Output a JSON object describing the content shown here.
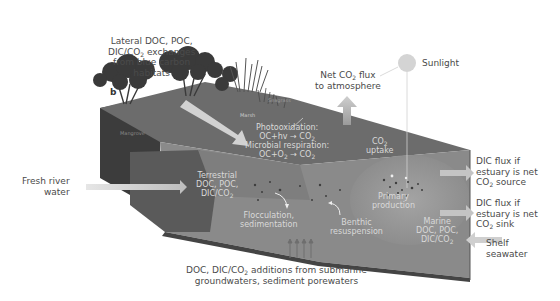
{
  "panel_label": "b",
  "labels": {
    "lateral_exchange": [
      "Lateral DOC, POC,",
      "DIC/CO",
      "2",
      " exchanges",
      "from blue carbon",
      "habitats"
    ],
    "net_co2_flux": [
      "Net CO",
      "2",
      " flux",
      "to atmosphere"
    ],
    "sunlight": "Sunlight",
    "fresh_river": [
      "Fresh river",
      "water"
    ],
    "dic_source": [
      "DIC flux if",
      "estuary is net",
      "CO",
      "2",
      " source"
    ],
    "dic_sink": [
      "DIC flux if",
      "estuary is net",
      "CO",
      "2",
      " sink"
    ],
    "shelf_seawater": [
      "Shelf",
      "seawater"
    ],
    "groundwater": [
      "DOC, DIC/CO",
      "2",
      " additions from submarine",
      "groundwaters, sediment porewaters"
    ]
  },
  "habitats": {
    "mangrove": "Mangrove",
    "marsh": "Marsh",
    "seagrass": "Seagrass"
  },
  "processes": {
    "photooxidation": [
      "Photooxidation:",
      "OC+hv → CO",
      "2"
    ],
    "microbial": [
      "Microbial respiration:",
      "OC+O",
      "2",
      " → CO",
      "2"
    ],
    "co2_uptake": [
      "CO",
      "2",
      "uptake"
    ],
    "terrestrial": [
      "Terrestrial",
      "DOC, POC,",
      "DIC/CO",
      "2"
    ],
    "flocculation": [
      "Flocculation,",
      "sedimentation"
    ],
    "benthic": [
      "Benthic",
      "resuspension"
    ],
    "primary": [
      "Primary",
      "production"
    ],
    "marine": [
      "Marine",
      "DOC, POC,",
      "DIC/CO",
      "2"
    ]
  },
  "colors": {
    "block_top": "#707070",
    "block_front": "#555555",
    "block_left": "#3a3a3a",
    "water": "#8a8a8a",
    "water_light": "#a0a0a0",
    "arrow": "#c8c8c8",
    "text": "#4a4a4a",
    "inner_text": "#dcdcdc",
    "sun": "#d4d4d4"
  }
}
